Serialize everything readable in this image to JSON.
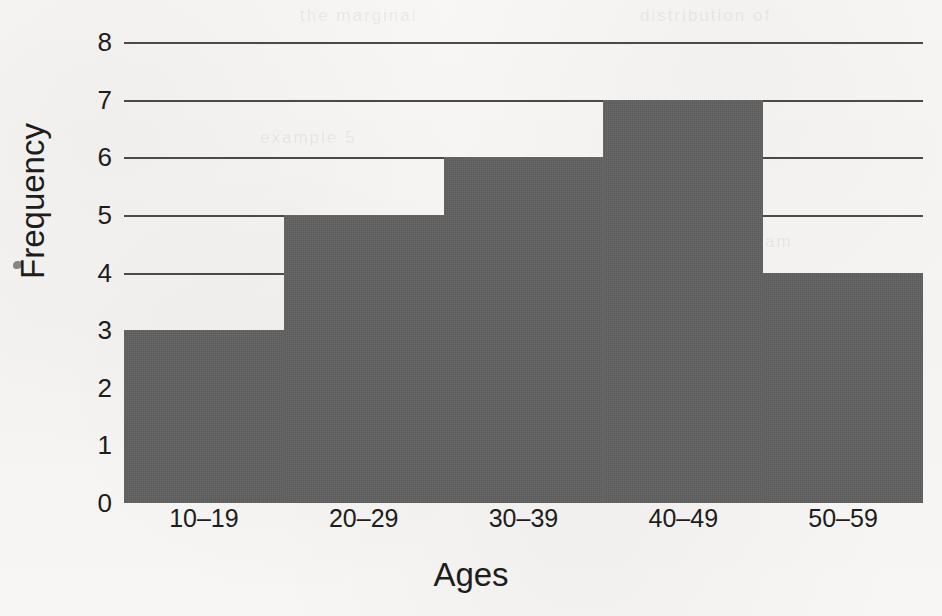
{
  "figure": {
    "background_color": "#f7f6f4",
    "bar_color": "#5e5e5e",
    "gridline_color": "#4a4a4a",
    "text_color": "#1d1d1d",
    "ghost_text": [
      "the marginal",
      "distribution of",
      "example 5",
      "histogram"
    ]
  },
  "chart_data": {
    "type": "bar",
    "title": "",
    "subtitle": "",
    "xlabel": "Ages",
    "ylabel": "Frequency",
    "categories": [
      "10–19",
      "20–29",
      "30–39",
      "40–49",
      "50–59"
    ],
    "values": [
      3,
      5,
      6,
      7,
      4
    ],
    "series": [
      {
        "name": "Frequency",
        "values": [
          3,
          5,
          6,
          7,
          4
        ]
      }
    ],
    "ylim": [
      0,
      8
    ],
    "ytick_labels": [
      "0",
      "1",
      "2",
      "3",
      "4",
      "5",
      "6",
      "7",
      "8"
    ],
    "ytick_values": [
      0,
      1,
      2,
      3,
      4,
      5,
      6,
      7,
      8
    ],
    "xtick_labels": [
      "10–19",
      "20–29",
      "30–39",
      "40–49",
      "50–59"
    ],
    "grid": true,
    "grid_axis": "y",
    "gridline_values": [
      4,
      5,
      6,
      7,
      8
    ],
    "legend": false,
    "legend_position": "none",
    "bar_gap": 0,
    "annotations": []
  }
}
